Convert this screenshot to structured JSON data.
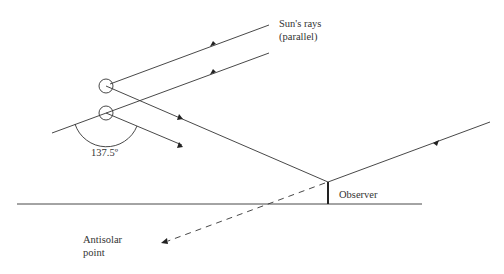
{
  "diagram": {
    "labels": {
      "sun_rays_line1": "Sun's rays",
      "sun_rays_line2": "(parallel)",
      "angle": "137.5º",
      "observer": "Observer",
      "antisolar_line1": "Antisolar",
      "antisolar_line2": "point"
    },
    "colors": {
      "line": "#333333",
      "text": "#333333",
      "background": "#ffffff"
    },
    "elements": [
      "two parallel sun rays with arrows pointing down-left",
      "two raindrops (circles)",
      "refracted ray from upper drop to observer",
      "refracted ray from lower drop",
      "sun ray arriving from right to observer",
      "observer vertical mark on ground line",
      "dashed line toward antisolar point",
      "137.5 degree angle arc at lower drop"
    ]
  }
}
